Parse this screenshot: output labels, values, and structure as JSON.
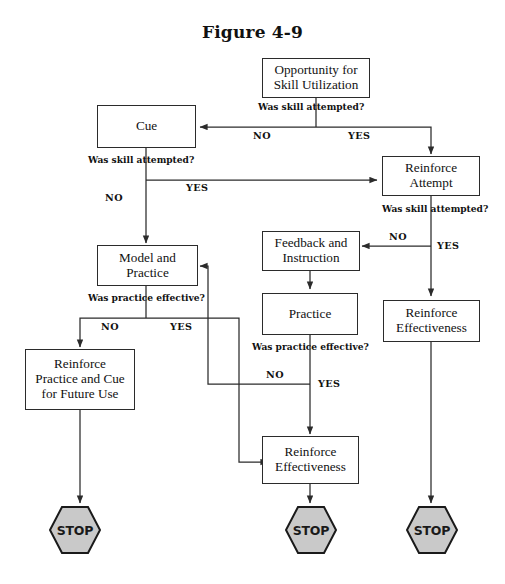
{
  "figure": {
    "title": "Figure 4-9",
    "type": "flowchart",
    "colors": {
      "line": "#2b2b2b",
      "box_border": "#2b2b2b",
      "box_fill": "#ffffff",
      "stop_fill": "#c9c9c9",
      "stop_border": "#1a1a1a",
      "text": "#111111"
    }
  },
  "nodes": [
    {
      "id": "opportunity",
      "label": "Opportunity for Skill Utilization",
      "lines": [
        "Opportunity for",
        "Skill Utilization"
      ],
      "shape": "rectangle"
    },
    {
      "id": "cue",
      "label": "Cue",
      "lines": [
        "Cue"
      ],
      "shape": "rectangle"
    },
    {
      "id": "reinforce_attempt",
      "label": "Reinforce Attempt",
      "lines": [
        "Reinforce",
        "Attempt"
      ],
      "shape": "rectangle"
    },
    {
      "id": "feedback_instruction",
      "label": "Feedback and Instruction",
      "lines": [
        "Feedback and",
        "Instruction"
      ],
      "shape": "rectangle"
    },
    {
      "id": "model_practice",
      "label": "Model and Practice",
      "lines": [
        "Model and",
        "Practice"
      ],
      "shape": "rectangle"
    },
    {
      "id": "practice",
      "label": "Practice",
      "lines": [
        "Practice"
      ],
      "shape": "rectangle"
    },
    {
      "id": "reinforce_effectiveness_right",
      "label": "Reinforce Effectiveness",
      "lines": [
        "Reinforce",
        "Effectiveness"
      ],
      "shape": "rectangle"
    },
    {
      "id": "reinforce_practice_cue",
      "label": "Reinforce Practice and Cue for Future Use",
      "lines": [
        "Reinforce",
        "Practice and Cue",
        "for Future Use"
      ],
      "shape": "rectangle"
    },
    {
      "id": "reinforce_effectiveness_bottom",
      "label": "Reinforce Effectiveness",
      "lines": [
        "Reinforce",
        "Effectiveness"
      ],
      "shape": "rectangle"
    },
    {
      "id": "stop_left",
      "label": "STOP",
      "shape": "hexagon"
    },
    {
      "id": "stop_middle",
      "label": "STOP",
      "shape": "hexagon"
    },
    {
      "id": "stop_right",
      "label": "STOP",
      "shape": "hexagon"
    }
  ],
  "decisions": [
    {
      "id": "decision_1",
      "question": "Was skill attempted?",
      "after": "opportunity"
    },
    {
      "id": "decision_2",
      "question": "Was skill attempted?",
      "after": "cue"
    },
    {
      "id": "decision_3",
      "question": "Was skill attempted?",
      "after": "reinforce_attempt"
    },
    {
      "id": "decision_4",
      "question": "Was practice effective?",
      "after": "model_practice"
    },
    {
      "id": "decision_5",
      "question": "Was practice effective?",
      "after": "practice"
    }
  ],
  "branch_labels": {
    "d1_no": "NO",
    "d1_yes": "YES",
    "d2_no": "NO",
    "d2_yes": "YES",
    "d3_no": "NO",
    "d3_yes": "YES",
    "d4_no": "NO",
    "d4_yes": "YES",
    "d5_no": "NO",
    "d5_yes": "YES"
  },
  "edges": [
    {
      "from": "opportunity",
      "to": "cue",
      "label": "NO"
    },
    {
      "from": "opportunity",
      "to": "reinforce_attempt",
      "label": "YES"
    },
    {
      "from": "cue",
      "to": "model_practice",
      "label": "NO"
    },
    {
      "from": "cue",
      "to": "reinforce_attempt",
      "label": "YES"
    },
    {
      "from": "reinforce_attempt",
      "to": "feedback_instruction",
      "label": "NO"
    },
    {
      "from": "reinforce_attempt",
      "to": "reinforce_effectiveness_right",
      "label": "YES"
    },
    {
      "from": "feedback_instruction",
      "to": "practice",
      "label": ""
    },
    {
      "from": "model_practice",
      "to": "reinforce_practice_cue",
      "label": "NO"
    },
    {
      "from": "model_practice",
      "to": "reinforce_effectiveness_bottom",
      "label": "YES"
    },
    {
      "from": "practice",
      "to": "model_practice",
      "label": "NO"
    },
    {
      "from": "practice",
      "to": "reinforce_effectiveness_bottom",
      "label": "YES"
    },
    {
      "from": "reinforce_practice_cue",
      "to": "stop_left",
      "label": ""
    },
    {
      "from": "reinforce_effectiveness_bottom",
      "to": "stop_middle",
      "label": ""
    },
    {
      "from": "reinforce_effectiveness_right",
      "to": "stop_right",
      "label": ""
    }
  ]
}
